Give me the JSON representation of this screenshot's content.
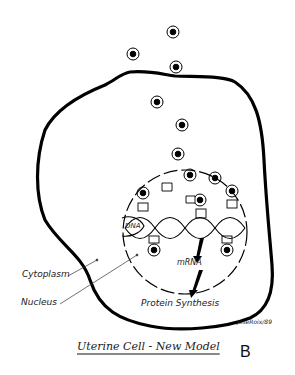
{
  "figure": {
    "title": "Uterine Cell - New Model",
    "panel_letter": "B",
    "signature": "JoseRoix/89"
  },
  "labels": {
    "cytoplasm": "Cytoplasm",
    "nucleus": "Nucleus",
    "dna": "DNA",
    "mrna": "mRNA",
    "protein_synthesis": "Protein Synthesis"
  },
  "elements": {
    "external_receptor_particles": 3,
    "cytoplasm_receptor_particles": 3,
    "nuclear_particles": 7,
    "binding_sites": 6
  },
  "colors": {
    "outline": "#000000",
    "background": "#ffffff",
    "text": "#222222"
  }
}
